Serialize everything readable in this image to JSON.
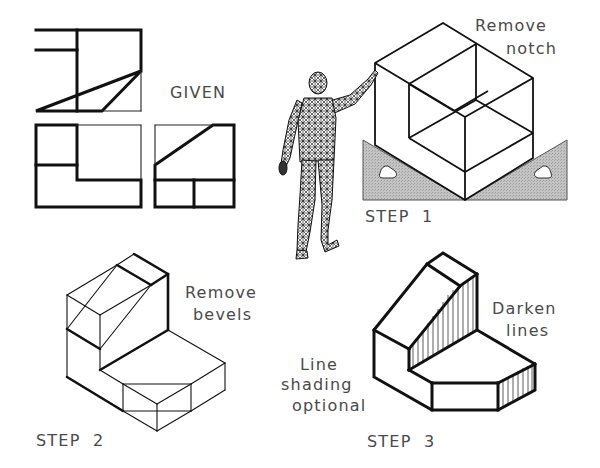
{
  "figure": {
    "labels": {
      "given": "GIVEN",
      "step1": "STEP  1",
      "step1_note_line1": "Remove",
      "step1_note_line2": "notch",
      "step2": "STEP  2",
      "step2_note_line1": "Remove",
      "step2_note_line2": "bevels",
      "step3": "STEP  3",
      "step3_note_line1": "Darken",
      "step3_note_line2": "lines",
      "shading_note_line1": "Line",
      "shading_note_line2": "shading",
      "shading_note_line3": "optional"
    },
    "colors": {
      "line": "#111111",
      "text": "#4a4a4a",
      "triangle_fill": "#b8b8b8",
      "background": "#ffffff"
    },
    "panels": [
      {
        "id": "given",
        "description": "Three orthographic views: top, front, right side"
      },
      {
        "id": "step1",
        "description": "Isometric box with notch sketched, drafting triangles below, human wireframe figure"
      },
      {
        "id": "step2",
        "description": "Isometric object with construction bevels"
      },
      {
        "id": "step3",
        "description": "Final isometric object with darkened lines and line shading"
      }
    ]
  }
}
